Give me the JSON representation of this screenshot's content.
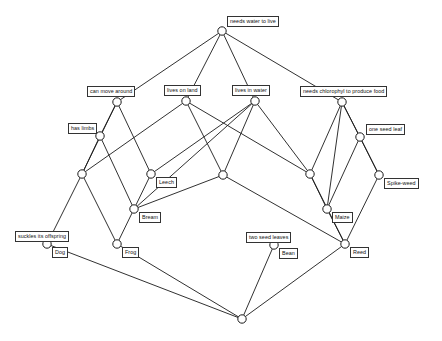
{
  "diagram": {
    "type": "hasse-diagram",
    "width": 442,
    "height": 341,
    "background_color": "#ffffff",
    "line_color": "#1a1a1a",
    "node_fill": "#ffffff",
    "node_radius": 4.2,
    "nodes": [
      {
        "id": "top",
        "x": 222,
        "y": 31,
        "label": "needs water to live",
        "label_dx": 5,
        "label_dy": -15,
        "has_label": true
      },
      {
        "id": "move",
        "x": 117,
        "y": 102,
        "label": "can move around",
        "label_dx": -30,
        "label_dy": -16,
        "has_label": true
      },
      {
        "id": "land",
        "x": 186,
        "y": 101,
        "label": "lives on land",
        "label_dx": -22,
        "label_dy": -16,
        "has_label": true
      },
      {
        "id": "water",
        "x": 255,
        "y": 101,
        "label": "lives in water",
        "label_dx": -23,
        "label_dy": -16,
        "has_label": true
      },
      {
        "id": "chloro",
        "x": 342,
        "y": 102,
        "label": "needs chlorophyl to produce food",
        "label_dx": -42,
        "label_dy": -16,
        "has_label": true
      },
      {
        "id": "limbs",
        "x": 100,
        "y": 136,
        "label": "has limbs",
        "label_dx": -32,
        "label_dy": -13,
        "has_label": true
      },
      {
        "id": "oneseed",
        "x": 360,
        "y": 137,
        "label": "one seed leaf",
        "label_dx": 6,
        "label_dy": -13,
        "has_label": true
      },
      {
        "id": "n1",
        "x": 82,
        "y": 174,
        "label": "",
        "label_dx": 0,
        "label_dy": 0,
        "has_label": false
      },
      {
        "id": "leech",
        "x": 151,
        "y": 174,
        "label": "Leech",
        "label_dx": 5,
        "label_dy": 3,
        "has_label": true
      },
      {
        "id": "n2",
        "x": 223,
        "y": 175,
        "label": "",
        "label_dx": 0,
        "label_dy": 0,
        "has_label": false
      },
      {
        "id": "n3",
        "x": 310,
        "y": 174,
        "label": "",
        "label_dx": 0,
        "label_dy": 0,
        "has_label": false
      },
      {
        "id": "spikeweed",
        "x": 379,
        "y": 175,
        "label": "Spike-weed",
        "label_dx": 5,
        "label_dy": 3,
        "has_label": true
      },
      {
        "id": "bream",
        "x": 134,
        "y": 209,
        "label": "Bream",
        "label_dx": 5,
        "label_dy": 3,
        "has_label": true
      },
      {
        "id": "maize",
        "x": 327,
        "y": 209,
        "label": "Maize",
        "label_dx": 5,
        "label_dy": 3,
        "has_label": true
      },
      {
        "id": "suckles",
        "x": 47,
        "y": 244,
        "label": "suckles its offspring",
        "label_dx": -32,
        "label_dy": -13,
        "has_label": false
      },
      {
        "id": "dog",
        "x": 47,
        "y": 244,
        "label": "Dog",
        "label_dx": 5,
        "label_dy": 3,
        "has_label": true
      },
      {
        "id": "frog",
        "x": 117,
        "y": 244,
        "label": "Frog",
        "label_dx": 5,
        "label_dy": 3,
        "has_label": true
      },
      {
        "id": "twoseed",
        "x": 274,
        "y": 245,
        "label": "two seed leaves",
        "label_dx": -29,
        "label_dy": -13,
        "has_label": false
      },
      {
        "id": "bean",
        "x": 274,
        "y": 245,
        "label": "Bean",
        "label_dx": 5,
        "label_dy": 3,
        "has_label": true
      },
      {
        "id": "reed",
        "x": 345,
        "y": 244,
        "label": "Reed",
        "label_dx": 5,
        "label_dy": 3,
        "has_label": true
      },
      {
        "id": "bottom",
        "x": 242,
        "y": 319,
        "label": "",
        "label_dx": 0,
        "label_dy": 0,
        "has_label": false
      }
    ],
    "extra_labels": [
      {
        "id": "suckles-label",
        "x": 15,
        "y": 231,
        "text": "suckles its offspring"
      },
      {
        "id": "twoseed-label",
        "x": 246,
        "y": 232,
        "text": "two seed leaves"
      }
    ],
    "edges": [
      [
        "top",
        "move"
      ],
      [
        "top",
        "land"
      ],
      [
        "top",
        "water"
      ],
      [
        "top",
        "chloro"
      ],
      [
        "move",
        "limbs"
      ],
      [
        "move",
        "leech"
      ],
      [
        "move",
        "n1"
      ],
      [
        "land",
        "n1"
      ],
      [
        "land",
        "n2"
      ],
      [
        "land",
        "n3"
      ],
      [
        "water",
        "leech"
      ],
      [
        "water",
        "n2"
      ],
      [
        "water",
        "n3"
      ],
      [
        "water",
        "bream"
      ],
      [
        "chloro",
        "oneseed"
      ],
      [
        "chloro",
        "n3"
      ],
      [
        "chloro",
        "maize"
      ],
      [
        "chloro",
        "spikeweed"
      ],
      [
        "limbs",
        "n1"
      ],
      [
        "limbs",
        "bream"
      ],
      [
        "oneseed",
        "spikeweed"
      ],
      [
        "oneseed",
        "maize"
      ],
      [
        "n1",
        "suckles"
      ],
      [
        "n1",
        "frog"
      ],
      [
        "n2",
        "bream"
      ],
      [
        "n2",
        "reed"
      ],
      [
        "leech",
        "bream"
      ],
      [
        "n3",
        "maize"
      ],
      [
        "n3",
        "reed"
      ],
      [
        "spikeweed",
        "reed"
      ],
      [
        "bream",
        "frog"
      ],
      [
        "maize",
        "reed"
      ],
      [
        "dog",
        "bottom"
      ],
      [
        "frog",
        "bottom"
      ],
      [
        "bean",
        "bottom"
      ],
      [
        "reed",
        "bottom"
      ]
    ]
  }
}
